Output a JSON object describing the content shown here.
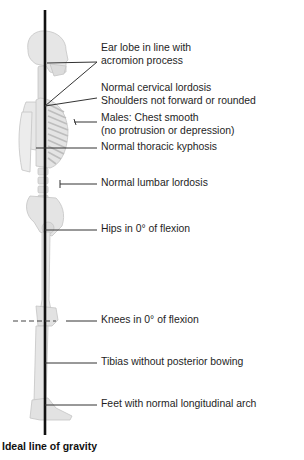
{
  "diagram": {
    "title": "Ideal line of gravity",
    "colors": {
      "background": "#ffffff",
      "line_of_gravity": "#111111",
      "bone_fill": "#e4e4e4",
      "bone_stroke": "#c8c8c8",
      "leader_lines": "#333333",
      "text": "#1e1e1e"
    },
    "labels": [
      {
        "id": "ear-lobe",
        "lines": [
          "Ear lobe in line with",
          "acromion process"
        ]
      },
      {
        "id": "cervical",
        "lines": [
          "Normal cervical lordosis",
          "Shoulders not forward or rounded"
        ]
      },
      {
        "id": "chest",
        "lines": [
          "Males: Chest smooth",
          "(no protrusion or depression)"
        ]
      },
      {
        "id": "thoracic",
        "lines": [
          "Normal thoracic kyphosis"
        ]
      },
      {
        "id": "lumbar",
        "lines": [
          "Normal lumbar lordosis"
        ]
      },
      {
        "id": "hips",
        "lines": [
          "Hips in 0° of flexion"
        ]
      },
      {
        "id": "knees",
        "lines": [
          "Knees in 0° of flexion"
        ]
      },
      {
        "id": "tibias",
        "lines": [
          "Tibias without posterior bowing"
        ]
      },
      {
        "id": "feet",
        "lines": [
          "Feet with normal longitudinal arch"
        ]
      }
    ]
  }
}
